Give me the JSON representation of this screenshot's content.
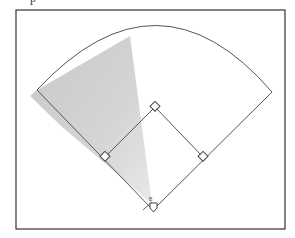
{
  "figure": {
    "title_fragment": "p",
    "colors": {
      "line": "#555555",
      "frame": "#333333",
      "shade": "#c8c8c8",
      "background": "#ffffff"
    },
    "frame": {
      "x": 16,
      "y": 10,
      "w": 269,
      "h": 219
    },
    "home_plate": {
      "x": 153,
      "y": 209,
      "label": "home-plate"
    },
    "bases": [
      {
        "name": "first-base",
        "x": 203,
        "y": 157
      },
      {
        "name": "second-base",
        "x": 155,
        "y": 107
      },
      {
        "name": "third-base",
        "x": 105,
        "y": 157
      }
    ],
    "foul_lines": {
      "left_end": {
        "x": 37,
        "y": 90
      },
      "right_end": {
        "x": 272,
        "y": 92
      }
    },
    "outfield_arc_peak": {
      "x": 158,
      "y": 21
    },
    "shaded_zone": {
      "apex": {
        "x": 152,
        "y": 204
      },
      "points": [
        [
          130,
          36
        ],
        [
          37,
          90
        ],
        [
          30,
          96
        ]
      ]
    },
    "batter_mark_label": "B"
  }
}
